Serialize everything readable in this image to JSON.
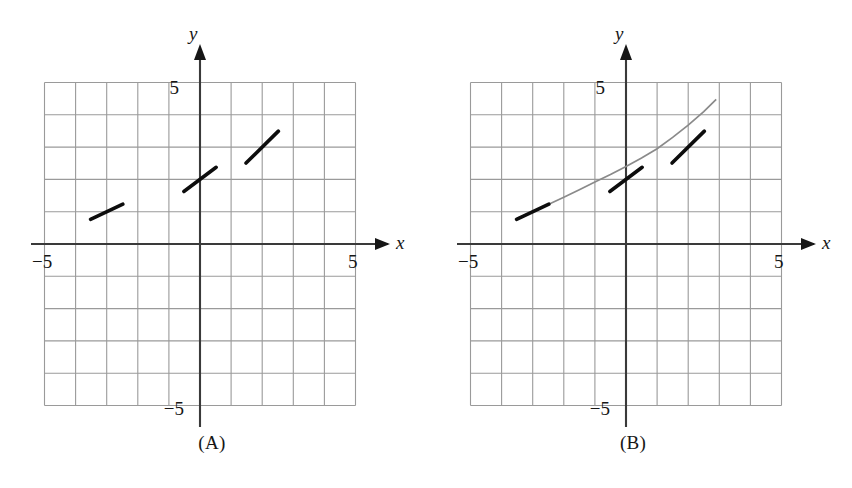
{
  "figure": {
    "type": "slope-field-diagram",
    "background_color": "#ffffff",
    "ink_color": "#161616",
    "grid_color": "#9a9a9a",
    "curve_color": "#8a8a8a"
  },
  "panels": [
    {
      "id": "A",
      "caption": "(A)",
      "axes": {
        "x_label": "x",
        "y_label": "y",
        "x_min_label": "−5",
        "x_max_label": "5",
        "y_min_label": "−5",
        "y_max_label": "5"
      },
      "has_solution_curve": false,
      "segments": [
        {
          "x": -3,
          "y": 1,
          "slope": 0.45
        },
        {
          "x": 0,
          "y": 2,
          "slope": 0.72
        },
        {
          "x": 2,
          "y": 3,
          "slope": 0.95
        }
      ]
    },
    {
      "id": "B",
      "caption": "(B)",
      "axes": {
        "x_label": "x",
        "y_label": "y",
        "x_min_label": "−5",
        "x_max_label": "5",
        "y_min_label": "−5",
        "y_max_label": "5"
      },
      "has_solution_curve": true,
      "segments": [
        {
          "x": -3,
          "y": 1,
          "slope": 0.45
        },
        {
          "x": 0,
          "y": 2,
          "slope": 0.72
        },
        {
          "x": 2,
          "y": 3,
          "slope": 0.95
        }
      ],
      "curve": {
        "description": "smooth increasing concave-up curve through the three slope segments",
        "x_start": -3.45,
        "x_end": 2.9,
        "points": [
          [
            -3.45,
            0.82
          ],
          [
            -3.0,
            1.0
          ],
          [
            -2.5,
            1.22
          ],
          [
            -2.0,
            1.45
          ],
          [
            -1.5,
            1.68
          ],
          [
            -1.0,
            1.92
          ],
          [
            -0.5,
            2.15
          ],
          [
            0.0,
            2.4
          ],
          [
            0.5,
            2.66
          ],
          [
            1.0,
            2.95
          ],
          [
            1.5,
            3.3
          ],
          [
            2.0,
            3.68
          ],
          [
            2.5,
            4.1
          ],
          [
            2.9,
            4.48
          ]
        ]
      }
    }
  ],
  "chart_data": {
    "type": "line",
    "title": "",
    "xlabel": "x",
    "ylabel": "y",
    "xlim": [
      -5,
      5
    ],
    "ylim": [
      -5,
      5
    ],
    "grid": true,
    "legend": "none",
    "panels": [
      {
        "name": "(A)",
        "series": [
          {
            "name": "slope-field segments",
            "kind": "segments",
            "points": [
              {
                "x": -3,
                "y": 1,
                "slope": 0.45
              },
              {
                "x": 0,
                "y": 2,
                "slope": 0.72
              },
              {
                "x": 2,
                "y": 3,
                "slope": 0.95
              }
            ]
          }
        ]
      },
      {
        "name": "(B)",
        "series": [
          {
            "name": "slope-field segments",
            "kind": "segments",
            "points": [
              {
                "x": -3,
                "y": 1,
                "slope": 0.45
              },
              {
                "x": 0,
                "y": 2,
                "slope": 0.72
              },
              {
                "x": 2,
                "y": 3,
                "slope": 0.95
              }
            ]
          },
          {
            "name": "solution curve",
            "kind": "curve",
            "x": [
              -3.45,
              -3.0,
              -2.5,
              -2.0,
              -1.5,
              -1.0,
              -0.5,
              0.0,
              0.5,
              1.0,
              1.5,
              2.0,
              2.5,
              2.9
            ],
            "y": [
              0.82,
              1.0,
              1.22,
              1.45,
              1.68,
              1.92,
              2.15,
              2.4,
              2.66,
              2.95,
              3.3,
              3.68,
              4.1,
              4.48
            ]
          }
        ]
      }
    ]
  }
}
